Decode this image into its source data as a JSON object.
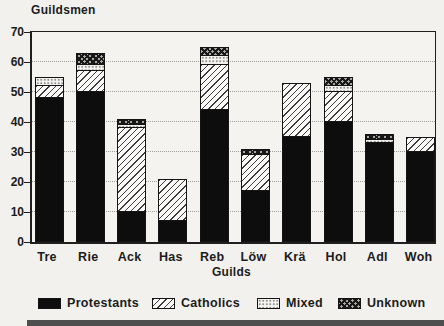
{
  "title": "Guildsmen",
  "chart_data": {
    "type": "bar",
    "stacked": true,
    "title": "Guildsmen",
    "xlabel": "Guilds",
    "ylabel": "Guildsmen",
    "ylim": [
      0,
      70
    ],
    "y_ticks": [
      0,
      10,
      20,
      30,
      40,
      50,
      60,
      70
    ],
    "grid": true,
    "legend_position": "bottom",
    "categories": [
      "Tre",
      "Rie",
      "Ack",
      "Has",
      "Reb",
      "Löw",
      "Krä",
      "Hol",
      "Adl",
      "Woh"
    ],
    "series": [
      {
        "name": "Protestants",
        "pattern": "solid-black",
        "color": "#0d0d0d",
        "values": [
          48,
          50,
          10,
          7,
          44,
          17,
          35,
          40,
          33,
          30
        ]
      },
      {
        "name": "Catholics",
        "pattern": "diagonal-hatch",
        "color": "#fbfaf8",
        "values": [
          4,
          7,
          28,
          14,
          15,
          12,
          18,
          10,
          0,
          5
        ]
      },
      {
        "name": "Mixed",
        "pattern": "light-dots",
        "color": "#f4f3ef",
        "values": [
          3,
          2,
          1,
          0,
          3,
          0,
          0,
          2,
          1,
          0
        ]
      },
      {
        "name": "Unknown",
        "pattern": "dark-crosshatch",
        "color": "#a9a7a3",
        "values": [
          0,
          4,
          2,
          0,
          3,
          2,
          0,
          3,
          2,
          0
        ]
      }
    ],
    "totals": [
      55,
      63,
      41,
      21,
      65,
      31,
      53,
      55,
      36,
      35
    ]
  }
}
